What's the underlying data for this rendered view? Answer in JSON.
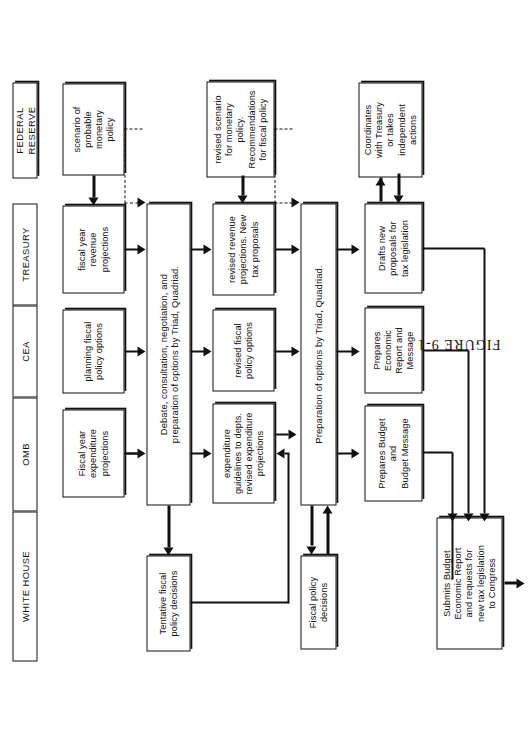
{
  "figure": {
    "caption": "FIGURE 9-1",
    "orientation": "rotated-90-ccw",
    "page_width": 528,
    "page_height": 745
  },
  "lanes": [
    {
      "id": "white-house",
      "label": "WHITE HOUSE"
    },
    {
      "id": "omb",
      "label": "OMB"
    },
    {
      "id": "cea",
      "label": "CEA"
    },
    {
      "id": "treasury",
      "label": "TREASURY"
    },
    {
      "id": "federal-reserve",
      "label": "FEDERAL\nRESERVE"
    }
  ],
  "nodes": [
    {
      "id": "n1",
      "lane": "federal-reserve",
      "stage": 1,
      "label": "scenario of\nprobable\nmonetary\npolicy"
    },
    {
      "id": "n2",
      "lane": "treasury",
      "stage": 1,
      "label": "fiscal year\nrevenue\nprojections"
    },
    {
      "id": "n3",
      "lane": "cea",
      "stage": 1,
      "label": "planning fiscal\npolicy options"
    },
    {
      "id": "n4",
      "lane": "omb",
      "stage": 1,
      "label": "Fiscal year\nexpenditure\nprojections"
    },
    {
      "id": "n5",
      "lane": "omb-treasury",
      "stage": 2,
      "label": "Debate, consultation, negotiation, and\npreparation of options by Triad, Quadriad."
    },
    {
      "id": "n6",
      "lane": "white-house",
      "stage": 2,
      "label": "Tentative fiscal\npolicy decisions"
    },
    {
      "id": "n7",
      "lane": "federal-reserve",
      "stage": 3,
      "label": "revised scenario\nfor monetary\npolicy.\nRecommendations\nfor fiscal policy"
    },
    {
      "id": "n8",
      "lane": "treasury",
      "stage": 3,
      "label": "revised revenue\nprojections. New\ntax proposals"
    },
    {
      "id": "n9",
      "lane": "cea",
      "stage": 3,
      "label": "revised fiscal\npolicy options"
    },
    {
      "id": "n10",
      "lane": "omb",
      "stage": 3,
      "label": "expenditure\nguidelines to depts.\nrevised expenditure\nprojections"
    },
    {
      "id": "n11",
      "lane": "omb-treasury",
      "stage": 4,
      "label": "Preparation of options by Triad, Quadriad."
    },
    {
      "id": "n12",
      "lane": "white-house",
      "stage": 4,
      "label": "Fiscal policy\ndecisions"
    },
    {
      "id": "n13",
      "lane": "federal-reserve",
      "stage": 5,
      "label": "Coordinates\nwith Treasury\nor takes\nindependent\nactions"
    },
    {
      "id": "n14",
      "lane": "treasury",
      "stage": 5,
      "label": "Drafts new\nproposals for\ntax legislation"
    },
    {
      "id": "n15",
      "lane": "cea",
      "stage": 5,
      "label": "Prepares\nEconomic\nReport and\nMessage"
    },
    {
      "id": "n16",
      "lane": "omb",
      "stage": 5,
      "label": "Prepares Budget\nand\nBudget Message"
    },
    {
      "id": "n17",
      "lane": "white-house",
      "stage": 6,
      "label": "Submits Budget\nEconomic Report\nand requests for\nnew tax legislation\nto Congress"
    }
  ],
  "edges": [
    {
      "from": "n1",
      "to": "n2",
      "style": "solid",
      "name": "fed-to-treasury-stage1"
    },
    {
      "from": "n1",
      "to": "n5",
      "style": "dashed",
      "name": "fed-dashed-to-debate"
    },
    {
      "from": "n2",
      "to": "n5",
      "style": "solid",
      "name": "treasury-to-debate"
    },
    {
      "from": "n3",
      "to": "n5",
      "style": "solid",
      "name": "cea-to-debate"
    },
    {
      "from": "n4",
      "to": "n5",
      "style": "solid",
      "name": "omb-to-debate"
    },
    {
      "from": "n5",
      "to": "n6",
      "style": "solid",
      "name": "debate-to-tentative"
    },
    {
      "from": "n5",
      "to": "n8",
      "style": "solid",
      "name": "debate-to-revised-revenue"
    },
    {
      "from": "n5",
      "to": "n9",
      "style": "solid",
      "name": "debate-to-revised-fiscal"
    },
    {
      "from": "n5",
      "to": "n10",
      "style": "solid",
      "name": "debate-to-expenditure-guidelines"
    },
    {
      "from": "n6",
      "to": "n10",
      "style": "solid",
      "name": "tentative-to-expenditure-guidelines"
    },
    {
      "from": "n7",
      "to": "n8",
      "style": "solid",
      "name": "revised-scenario-to-revenue"
    },
    {
      "from": "n7",
      "to": "n11",
      "style": "dashed",
      "name": "revised-scenario-dashed-to-preparation"
    },
    {
      "from": "n8",
      "to": "n11",
      "style": "solid",
      "name": "revised-revenue-to-preparation"
    },
    {
      "from": "n9",
      "to": "n11",
      "style": "solid",
      "name": "revised-fiscal-to-preparation"
    },
    {
      "from": "n10",
      "to": "n11",
      "style": "solid",
      "name": "expenditure-to-preparation"
    },
    {
      "from": "n11",
      "to": "n12",
      "style": "solid",
      "name": "preparation-to-fiscal-decisions"
    },
    {
      "from": "n12",
      "to": "n11",
      "style": "solid",
      "name": "fiscal-decisions-back-to-preparation"
    },
    {
      "from": "n11",
      "to": "n14",
      "style": "solid",
      "name": "preparation-to-drafts-new"
    },
    {
      "from": "n11",
      "to": "n15",
      "style": "solid",
      "name": "preparation-to-economic-report"
    },
    {
      "from": "n11",
      "to": "n16",
      "style": "solid",
      "name": "preparation-to-budget-message"
    },
    {
      "from": "n14",
      "to": "n13",
      "style": "solid",
      "name": "drafts-to-coordinates"
    },
    {
      "from": "n13",
      "to": "n14",
      "style": "solid",
      "name": "coordinates-to-drafts"
    },
    {
      "from": "n14",
      "to": "n17",
      "style": "solid",
      "name": "drafts-to-submits"
    },
    {
      "from": "n15",
      "to": "n17",
      "style": "solid",
      "name": "economic-report-to-submits"
    },
    {
      "from": "n16",
      "to": "n17",
      "style": "solid",
      "name": "budget-message-to-submits"
    },
    {
      "from": "n17",
      "to": "congress",
      "style": "solid",
      "name": "submits-to-congress-out"
    }
  ]
}
